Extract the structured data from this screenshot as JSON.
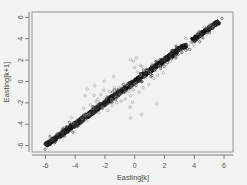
{
  "figure": {
    "background_color": "#f2f2f0",
    "plot_background_color": "#f2f2f0",
    "frame_color": "#8c8c8c",
    "point_color": "#1a1a1a",
    "outlier_color": "#9a9a9a"
  },
  "chart_data": {
    "type": "scatter",
    "title": "",
    "xlabel": "Easting[k]",
    "ylabel": "Easting[k+1]",
    "xlim": [
      -6.9,
      6.6
    ],
    "ylim": [
      -6.6,
      6.5
    ],
    "xticks": [
      -6,
      -4,
      -2,
      0,
      2,
      4,
      6
    ],
    "xticklabels": [
      "-6",
      "-4",
      "-2",
      "0",
      "2",
      "4",
      "6"
    ],
    "yticks": [
      -6,
      -4,
      -2,
      0,
      2,
      4,
      6
    ],
    "yticklabels": [
      "-6",
      "-4",
      "-2",
      "0",
      "2",
      "4",
      "6"
    ],
    "grid": false,
    "legend": null,
    "marker": "open-circle",
    "series": [
      {
        "name": "main-band",
        "x": [
          -5.93,
          -5.88,
          -5.82,
          -5.76,
          -5.7,
          -5.64,
          -5.58,
          -5.52,
          -5.46,
          -5.4,
          -5.34,
          -5.28,
          -5.22,
          -5.16,
          -5.1,
          -5.04,
          -4.98,
          -4.92,
          -4.86,
          -4.8,
          -4.74,
          -4.68,
          -4.62,
          -4.56,
          -4.5,
          -4.44,
          -4.38,
          -4.32,
          -4.26,
          -4.2,
          -4.14,
          -4.08,
          -4.02,
          -3.96,
          -3.9,
          -3.84,
          -3.78,
          -3.72,
          -3.66,
          -3.6,
          -3.54,
          -3.48,
          -3.42,
          -3.36,
          -3.3,
          -3.24,
          -3.18,
          -3.12,
          -3.06,
          -3.0,
          -2.94,
          -2.88,
          -2.82,
          -2.76,
          -2.7,
          -2.64,
          -2.58,
          -2.52,
          -2.46,
          -2.4,
          -2.34,
          -2.28,
          -2.22,
          -2.16,
          -2.1,
          -2.04,
          -1.98,
          -1.92,
          -1.86,
          -1.8,
          -1.74,
          -1.68,
          -1.62,
          -1.56,
          -1.5,
          -1.44,
          -1.38,
          -1.32,
          -1.26,
          -1.2,
          -1.14,
          -1.08,
          -1.02,
          -0.96,
          -0.9,
          -0.84,
          -0.78,
          -0.72,
          -0.66,
          -0.6,
          -0.54,
          -0.48,
          -0.42,
          -0.36,
          -0.3,
          -0.24,
          -0.18,
          -0.12,
          -0.06,
          0.0,
          0.06,
          0.12,
          0.18,
          0.24,
          0.3,
          0.36,
          0.42,
          0.48,
          0.54,
          0.6,
          0.66,
          0.72,
          0.78,
          0.84,
          0.9,
          0.96,
          1.02,
          1.08,
          1.14,
          1.2,
          1.26,
          1.32,
          1.38,
          1.44,
          1.5,
          1.56,
          1.62,
          1.68,
          1.74,
          1.8,
          1.86,
          1.92,
          1.98,
          2.04,
          2.1,
          2.16,
          2.22,
          2.28,
          2.34,
          2.4,
          2.46,
          2.52,
          2.58,
          2.64,
          2.7,
          2.76,
          2.82,
          2.88,
          2.94,
          3.0,
          3.06,
          3.12,
          3.18,
          3.24,
          3.3,
          3.36,
          3.42,
          3.9,
          3.98,
          4.06,
          4.14,
          4.22,
          4.3,
          4.38,
          4.46,
          4.54,
          4.62,
          4.7,
          4.78,
          4.86,
          4.94,
          5.02,
          5.1,
          5.18,
          5.26,
          5.34,
          5.42,
          5.5,
          5.56,
          5.6
        ],
        "y": [
          -5.95,
          -5.86,
          -5.85,
          -5.72,
          -5.74,
          -5.6,
          -5.62,
          -5.49,
          -5.5,
          -5.37,
          -5.38,
          -5.25,
          -5.26,
          -5.13,
          -5.14,
          -5.01,
          -5.02,
          -4.89,
          -4.9,
          -4.77,
          -4.78,
          -4.65,
          -4.66,
          -4.53,
          -4.54,
          -4.41,
          -4.42,
          -4.29,
          -4.3,
          -4.17,
          -4.18,
          -4.05,
          -4.06,
          -3.93,
          -3.94,
          -3.81,
          -3.82,
          -3.69,
          -3.7,
          -3.57,
          -3.58,
          -3.45,
          -3.46,
          -3.33,
          -3.34,
          -3.21,
          -3.22,
          -3.09,
          -3.1,
          -2.97,
          -2.98,
          -2.85,
          -2.86,
          -2.73,
          -2.74,
          -2.61,
          -2.62,
          -2.49,
          -2.5,
          -2.37,
          -2.38,
          -2.25,
          -2.26,
          -2.13,
          -2.14,
          -2.01,
          -2.02,
          -1.89,
          -1.9,
          -1.77,
          -1.78,
          -1.65,
          -1.66,
          -1.53,
          -1.54,
          -1.41,
          -1.42,
          -1.29,
          -1.3,
          -1.17,
          -1.18,
          -1.05,
          -1.06,
          -0.93,
          -0.94,
          -0.81,
          -0.82,
          -0.69,
          -0.7,
          -0.57,
          -0.58,
          -0.45,
          -0.46,
          -0.33,
          -0.34,
          -0.21,
          -0.22,
          -0.09,
          -0.1,
          0.03,
          0.02,
          0.15,
          0.14,
          0.27,
          0.26,
          0.39,
          0.38,
          0.51,
          0.5,
          0.63,
          0.62,
          0.75,
          0.74,
          0.87,
          0.86,
          0.99,
          0.98,
          1.11,
          1.1,
          1.23,
          1.22,
          1.35,
          1.34,
          1.47,
          1.46,
          1.59,
          1.58,
          1.71,
          1.7,
          1.83,
          1.82,
          1.95,
          1.94,
          2.07,
          2.06,
          2.19,
          2.18,
          2.31,
          2.3,
          2.43,
          2.42,
          2.55,
          2.54,
          2.67,
          2.66,
          2.79,
          2.78,
          2.91,
          2.9,
          3.03,
          3.02,
          3.15,
          3.14,
          3.27,
          3.26,
          3.35,
          3.4,
          3.86,
          3.95,
          4.02,
          4.12,
          4.18,
          4.28,
          4.34,
          4.44,
          4.5,
          4.6,
          4.66,
          4.76,
          4.82,
          4.92,
          4.98,
          5.08,
          5.14,
          5.24,
          5.3,
          5.4,
          5.46,
          5.5,
          5.54
        ]
      },
      {
        "name": "outliers",
        "x": [
          -4.3,
          -4.22,
          -3.6,
          -3.45,
          -3.38,
          -3.3,
          -3.25,
          -3.1,
          -2.95,
          -2.8,
          -2.72,
          -2.6,
          -2.5,
          -2.4,
          -2.3,
          -2.2,
          -2.1,
          -1.95,
          -1.85,
          -1.7,
          -1.6,
          -1.5,
          -1.4,
          -1.3,
          -1.2,
          -1.1,
          -1.0,
          -0.9,
          -0.8,
          -0.7,
          -0.6,
          -0.5,
          -0.4,
          -0.35,
          -0.3,
          -0.25,
          -0.2,
          -0.15,
          -0.1,
          0.0,
          0.1,
          0.2,
          0.3,
          0.4,
          0.5,
          0.6,
          0.7,
          0.8,
          0.9,
          1.0,
          1.1,
          1.25,
          1.4,
          1.55,
          1.7,
          1.9,
          2.1,
          2.4,
          2.8,
          3.2,
          3.45,
          3.6,
          3.8,
          4.0,
          4.2,
          4.45,
          4.65,
          4.9,
          5.1,
          5.3,
          -0.25,
          -0.1,
          0.15,
          0.35,
          -1.45,
          -2.05,
          -2.65,
          -3.15,
          0.45,
          1.45
        ],
        "y": [
          -3.35,
          -3.95,
          -3.4,
          -2.55,
          -3.15,
          -1.3,
          -3.7,
          -3.05,
          -2.15,
          -2.6,
          -1.35,
          -1.95,
          -1.65,
          -2.95,
          -1.25,
          -2.35,
          -0.85,
          -1.55,
          -2.75,
          -0.95,
          -1.75,
          -2.25,
          -0.65,
          -1.45,
          -2.05,
          -0.55,
          -1.15,
          -1.85,
          -0.35,
          -1.05,
          -1.65,
          -0.25,
          -0.95,
          -2.35,
          -1.35,
          -3.45,
          -0.45,
          -1.95,
          -0.75,
          1.25,
          -0.15,
          0.95,
          -1.05,
          0.65,
          1.45,
          -0.55,
          0.35,
          1.15,
          -0.35,
          0.85,
          1.55,
          0.25,
          1.05,
          0.55,
          1.35,
          0.75,
          1.65,
          1.95,
          2.35,
          2.85,
          3.95,
          3.35,
          3.7,
          3.45,
          4.55,
          4.15,
          5.05,
          4.45,
          5.35,
          4.95,
          2.05,
          1.85,
          2.15,
          1.55,
          0.45,
          -0.05,
          -0.45,
          -0.75,
          -3.05,
          -2.05
        ]
      }
    ]
  }
}
